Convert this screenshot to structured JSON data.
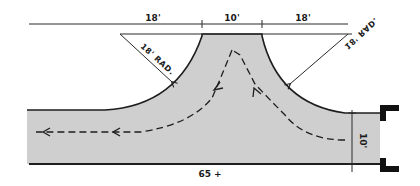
{
  "diagram": {
    "type": "road-turnaround-T-plan",
    "colors": {
      "pavement": "#cfcfcf",
      "line": "#1e1e1e",
      "background": "#ffffff"
    },
    "dimensions": {
      "left_width": "18'",
      "stem_width": "10'",
      "right_width": "18'",
      "left_radius": "18' RAD.",
      "right_radius": "18' RAD.",
      "road_width": "10'",
      "road_length": "65 +"
    },
    "paths": [
      {
        "name": "left-turn-path",
        "direction": "from stem to left"
      },
      {
        "name": "right-entry-path",
        "direction": "from right into stem"
      }
    ]
  }
}
